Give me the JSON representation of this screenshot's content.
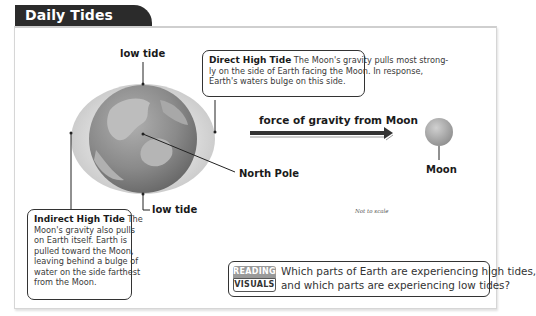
{
  "header": {
    "title": "Daily Tides"
  },
  "labels": {
    "low_tide_top": "low tide",
    "low_tide_bottom": "low tide",
    "north_pole": "North Pole",
    "force": "force of gravity from Moon",
    "moon": "Moon",
    "not_to_scale": "Not to scale"
  },
  "callouts": {
    "direct": {
      "title": "Direct High Tide",
      "lines": [
        "The Moon's gravity pulls most strong-",
        "ly on the side of Earth facing the Moon. In response,",
        "Earth's waters bulge on this side."
      ]
    },
    "indirect": {
      "title": "Indirect High Tide",
      "lines": [
        "The",
        "Moon's gravity also pulls",
        "on Earth itself. Earth is",
        "pulled toward the Moon,",
        "leaving behind a bulge of",
        "water on the side farthest",
        "from the Moon."
      ]
    }
  },
  "reading_visuals": {
    "badge_top": "READING",
    "badge_bottom": "VISUALS",
    "question_line1": "Which parts of Earth are experiencing high tides,",
    "question_line2": "and which parts are experiencing low tides?"
  },
  "colors": {
    "tab_bg": "#2b2b2b",
    "water_bulge": "#d9d9d9",
    "globe_ocean": "#8c8c8c",
    "globe_land": "#b8b8b8",
    "moon": "#a8a8a8"
  }
}
